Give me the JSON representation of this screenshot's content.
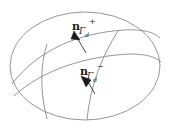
{
  "figure": {
    "background_color": "#ffffff",
    "stroke_color": "#8a8a8a",
    "text_color": "#1a1a1a",
    "width": 171,
    "height": 134,
    "labels": {
      "normal_plus": {
        "base": "n",
        "superscript": "+",
        "subscript": "Γ",
        "subscript_index": "d",
        "full_text": "nΓd+",
        "meaning": "outward-normal-positive-side"
      },
      "normal_minus": {
        "base": "n",
        "superscript": "−",
        "subscript": "Γ",
        "subscript_index": "d",
        "full_text": "nΓd−",
        "meaning": "outward-normal-negative-side"
      }
    },
    "geometry": {
      "outer_boundary": "ellipse",
      "interface_curves": 3,
      "arrow_count": 2
    }
  }
}
